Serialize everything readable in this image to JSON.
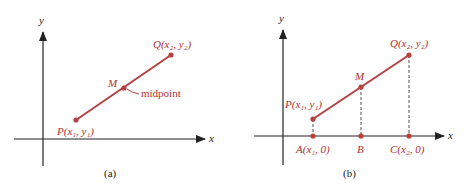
{
  "colors": {
    "segment": "#b5403f",
    "axis": "#222222",
    "label": "#b03030"
  },
  "panel_a": {
    "caption": "(a)",
    "y_axis_label": "y",
    "x_axis_label": "x",
    "point_p": "P(x₁, y₁)",
    "point_q": "Q(x₂, y₂)",
    "point_m": "M",
    "midpoint_label": "midpoint"
  },
  "panel_b": {
    "caption": "(b)",
    "y_axis_label": "y",
    "x_axis_label": "x",
    "point_p": "P(x₁, y₁)",
    "point_q": "Q(x₂, y₂)",
    "point_m": "M",
    "point_a": "A(x₁, 0)",
    "point_b": "B",
    "point_c": "C(x₂, 0)"
  }
}
